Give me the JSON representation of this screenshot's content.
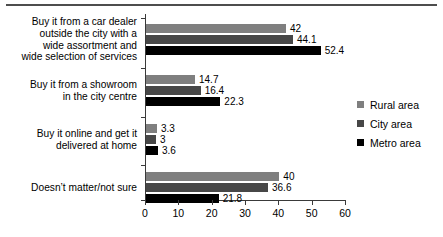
{
  "chart_data": {
    "type": "bar",
    "orientation": "horizontal",
    "title": "",
    "xlabel": "",
    "ylabel": "",
    "xlim": [
      0,
      60
    ],
    "xticks": [
      "0",
      "10",
      "20",
      "30",
      "40",
      "50",
      "60"
    ],
    "grid": false,
    "legend_position": "right",
    "categories": [
      "Buy it from a car dealer outside the city with a wide assortment and wide selection of services",
      "Buy it from a showroom in the city centre",
      "Buy it online and get it delivered at home",
      "Doesn’t matter/not sure"
    ],
    "category_lines": [
      [
        "Buy it from a car dealer",
        "outside the city with a",
        "wide assortment and",
        "wide selection of services"
      ],
      [
        "Buy it from a showroom",
        "in the city centre"
      ],
      [
        "Buy it online and get it",
        "delivered at home"
      ],
      [
        "Doesn’t matter/not sure"
      ]
    ],
    "series": [
      {
        "name": "Rural area",
        "color": "#7f7f7f",
        "values": [
          42,
          14.7,
          3.3,
          40
        ],
        "labels": [
          "42",
          "14.7",
          "3.3",
          "40"
        ]
      },
      {
        "name": "City area",
        "color": "#474747",
        "values": [
          44.1,
          16.4,
          3,
          36.6
        ],
        "labels": [
          "44.1",
          "16.4",
          "3",
          "36.6"
        ]
      },
      {
        "name": "Metro area",
        "color": "#000000",
        "values": [
          52.4,
          22.3,
          3.6,
          21.8
        ],
        "labels": [
          "52.4",
          "22.3",
          "3.6",
          "21.8"
        ]
      }
    ]
  },
  "legend": {
    "items": [
      {
        "label": "Rural area",
        "color": "#7f7f7f"
      },
      {
        "label": "City area",
        "color": "#474747"
      },
      {
        "label": "Metro area",
        "color": "#000000"
      }
    ]
  }
}
